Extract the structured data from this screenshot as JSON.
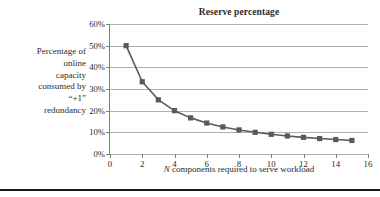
{
  "figure": {
    "title": "Reserve percentage",
    "y_axis_title_lines": [
      "Percentage of",
      "online",
      "capacity",
      "consumed by",
      "“+1”",
      "redundancy"
    ],
    "x_axis_title_prefix": "N",
    "x_axis_title_rest": " components required to serve workload",
    "series_color": "#595959",
    "gridline_color": "#b0b0b0",
    "axis_color": "#808080",
    "rule_color": "#1a1a1a"
  },
  "chart_data": {
    "type": "line",
    "title": "Reserve percentage",
    "xlabel": "N components required to serve workload",
    "ylabel": "Percentage of online capacity consumed by “+1” redundancy",
    "xlim": [
      0,
      16
    ],
    "ylim": [
      0,
      0.6
    ],
    "grid": true,
    "legend": "none",
    "marker": "square",
    "x_ticks": [
      0,
      2,
      4,
      6,
      8,
      10,
      12,
      14,
      16
    ],
    "x_tick_labels": [
      "0",
      "2",
      "4",
      "6",
      "8",
      "10",
      "12",
      "14",
      "16"
    ],
    "y_ticks": [
      0,
      0.1,
      0.2,
      0.3,
      0.4,
      0.5,
      0.6
    ],
    "y_tick_labels": [
      "0%",
      "10%",
      "20%",
      "30%",
      "40%",
      "50%",
      "60%"
    ],
    "series": [
      {
        "name": "Reserve percentage",
        "formula": "1/(N+1)",
        "x": [
          1,
          2,
          3,
          4,
          5,
          6,
          7,
          8,
          9,
          10,
          11,
          12,
          13,
          14,
          15
        ],
        "values": [
          0.5,
          0.3333,
          0.25,
          0.2,
          0.1667,
          0.1429,
          0.125,
          0.1111,
          0.1,
          0.0909,
          0.0833,
          0.0769,
          0.0714,
          0.0667,
          0.0625
        ],
        "value_labels": [
          "50%",
          "33.3%",
          "25%",
          "20%",
          "16.7%",
          "14.3%",
          "12.5%",
          "11.1%",
          "10%",
          "9.1%",
          "8.3%",
          "7.7%",
          "7.1%",
          "6.7%",
          "6.3%"
        ]
      }
    ]
  }
}
